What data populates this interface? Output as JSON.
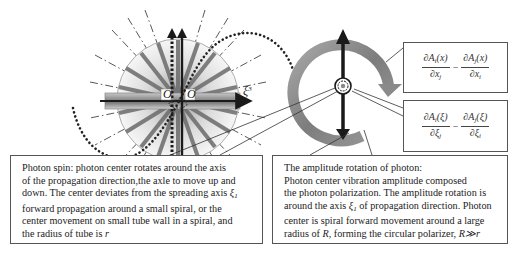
{
  "diagram": {
    "left_figure": {
      "origin_label_left": "O",
      "origin_label_right": "O",
      "axis_label": "ξ",
      "axis_label_superscript": "3"
    },
    "formulas": [
      {
        "term1_num": "∂A",
        "term1_num_sub": "i",
        "term1_num_arg": "(x)",
        "term1_den": "∂x",
        "term1_den_sub": "j",
        "operator": "−",
        "term2_num": "∂A",
        "term2_num_sub": "j",
        "term2_num_arg": "(x)",
        "term2_den": "∂x",
        "term2_den_sub": "i"
      },
      {
        "term1_num": "∂A",
        "term1_num_sub": "i",
        "term1_num_arg": "(ξ)",
        "term1_den": "∂ξ",
        "term1_den_sub": "j",
        "operator": "−",
        "term2_num": "∂A",
        "term2_num_sub": "j",
        "term2_num_arg": "(ξ)",
        "term2_den": "∂ξ",
        "term2_den_sub": "i"
      }
    ],
    "spin_box": {
      "lines": [
        "Photon spin: photon center  rotates around the axis",
        "of the propagation direction,the axle to move up and",
        "down. The center deviates from the spreading axis ",
        "forward propagation around a small spiral, or the",
        "center movement on small tube wall in a spiral, and",
        "the radius of tube is "
      ],
      "axis_symbol": "ξ",
      "axis_symbol_sub": "1",
      "radius_symbol": "r"
    },
    "amplitude_box": {
      "lines": [
        "The amplitude rotation of photon:",
        "Photon center vibration amplitude composed",
        "the photon polarization. The amplitude rotation is",
        "around the axis ",
        " of propagation direction. Photon",
        "center is spiral forward movement around a large",
        " radius of ",
        ", forming the circular polarizer, "
      ],
      "axis_symbol": "ξ",
      "axis_symbol_sub": "1",
      "big_radius_symbol": "R",
      "relation": "R≫r"
    }
  },
  "colors": {
    "ring": "#8a8a8a",
    "ring_highlight": "#b5b5b5",
    "arrow": "#1a1a1a",
    "border": "#555555",
    "dots": "#222222"
  }
}
